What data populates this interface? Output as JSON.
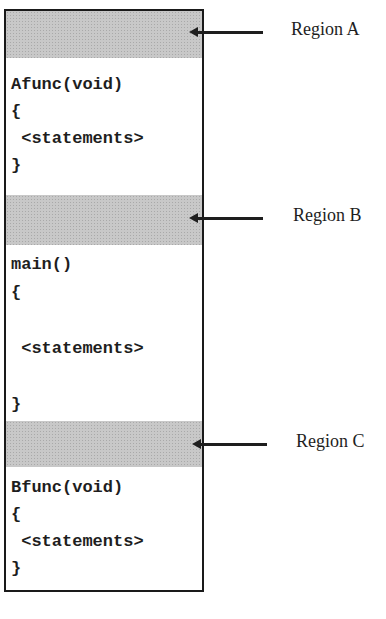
{
  "diagram": {
    "regions": [
      {
        "id": "A",
        "label": "Region A"
      },
      {
        "id": "B",
        "label": "Region B"
      },
      {
        "id": "C",
        "label": "Region C"
      }
    ],
    "code_blocks": [
      {
        "name": "afunc",
        "text": "Afunc(void)\n{\n <statements>\n}"
      },
      {
        "name": "main",
        "text": "main()\n{\n\n <statements>\n\n}"
      },
      {
        "name": "bfunc",
        "text": "Bfunc(void)\n{\n <statements>\n}"
      }
    ],
    "colors": {
      "region_fill": "#c8c8c8",
      "ink": "#1e1e1e"
    }
  }
}
